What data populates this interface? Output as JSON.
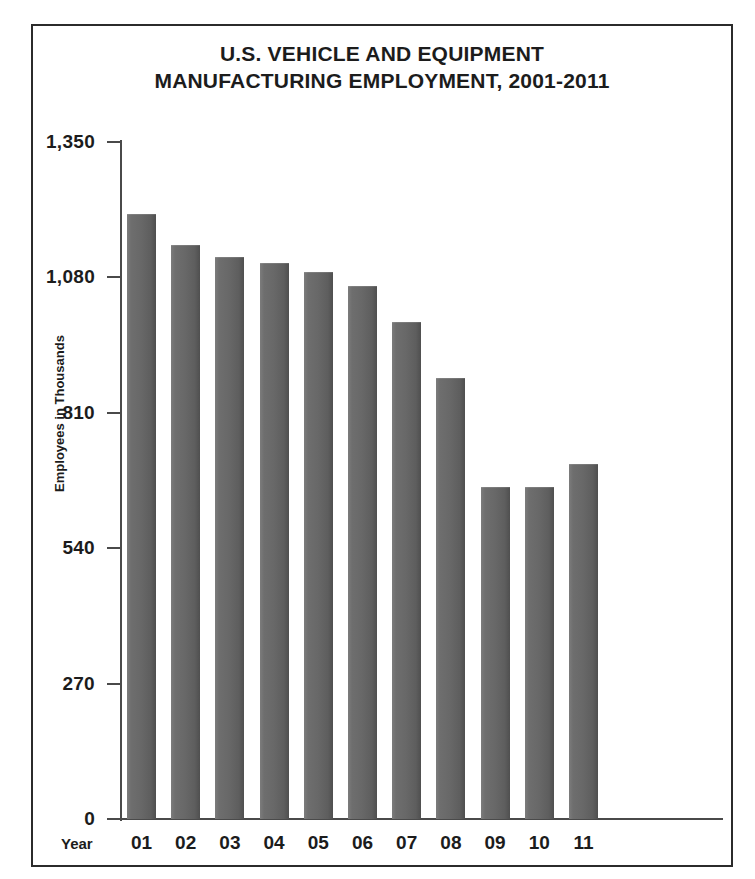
{
  "figure": {
    "border_color": "#2b2b2b",
    "background": "#ffffff"
  },
  "title": {
    "line1": "U.S. VEHICLE AND EQUIPMENT",
    "line2": "MANUFACTURING EMPLOYMENT, 2001-2011"
  },
  "axes": {
    "y_title": "Employees in Thousands",
    "x_title": "Year",
    "y_ticks": [
      "0",
      "270",
      "540",
      "810",
      "1,080",
      "1,350"
    ],
    "x_ticks": [
      "01",
      "02",
      "03",
      "04",
      "05",
      "06",
      "07",
      "08",
      "09",
      "10",
      "11"
    ]
  },
  "chart_data": {
    "type": "bar",
    "title": "U.S. VEHICLE AND EQUIPMENT MANUFACTURING EMPLOYMENT, 2001-2011",
    "xlabel": "Year",
    "ylabel": "Employees in Thousands",
    "categories": [
      "01",
      "02",
      "03",
      "04",
      "05",
      "06",
      "07",
      "08",
      "09",
      "10",
      "11"
    ],
    "values": [
      1206,
      1144,
      1121,
      1109,
      1091,
      1063,
      991,
      879,
      662,
      662,
      708
    ],
    "ylim": [
      0,
      1350
    ],
    "ytick_values": [
      0,
      270,
      540,
      810,
      1080,
      1350
    ],
    "grid": false,
    "legend": null,
    "bar_color": "#686868",
    "units": "thousands of employees"
  }
}
